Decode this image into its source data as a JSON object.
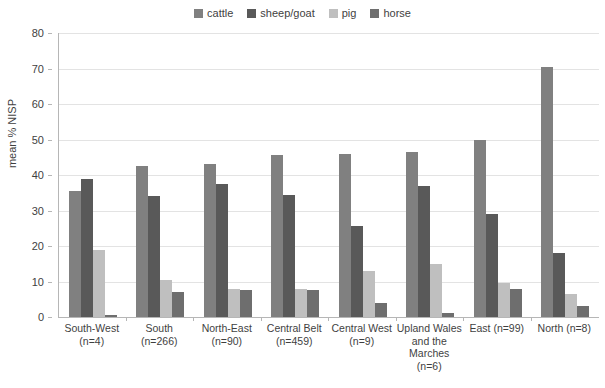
{
  "chart_data": {
    "type": "bar",
    "title": "",
    "xlabel": "",
    "ylabel": "mean % NISP",
    "ylim": [
      0,
      80
    ],
    "ytick_step": 10,
    "yticks": [
      80,
      70,
      60,
      50,
      40,
      30,
      20,
      10,
      0
    ],
    "grid": true,
    "legend_position": "top-center",
    "categories": [
      "South-West\n(n=4)",
      "South\n(n=266)",
      "North-East\n(n=90)",
      "Central Belt\n(n=459)",
      "Central West\n(n=9)",
      "Upland Wales and the Marches\n(n=6)",
      "East (n=99)",
      "North (n=8)"
    ],
    "category_lines": [
      [
        "South-West",
        "(n=4)"
      ],
      [
        "South",
        "(n=266)"
      ],
      [
        "North-East",
        "(n=90)"
      ],
      [
        "Central Belt",
        "(n=459)"
      ],
      [
        "Central West",
        "(n=9)"
      ],
      [
        "Upland Wales",
        "and the",
        "Marches",
        "(n=6)"
      ],
      [
        "East (n=99)"
      ],
      [
        "North (n=8)"
      ]
    ],
    "series": [
      {
        "name": "cattle",
        "color": "#808080",
        "values": [
          35.5,
          42.5,
          43.0,
          45.5,
          46.0,
          46.5,
          50.0,
          70.5
        ]
      },
      {
        "name": "sheep/goat",
        "color": "#595959",
        "values": [
          39.0,
          34.0,
          37.5,
          34.5,
          25.5,
          37.0,
          29.0,
          18.0
        ]
      },
      {
        "name": "pig",
        "color": "#bfbfbf",
        "values": [
          19.0,
          10.5,
          8.0,
          8.0,
          13.0,
          15.0,
          9.5,
          6.5
        ]
      },
      {
        "name": "horse",
        "color": "#6e6e6e",
        "values": [
          0.5,
          7.0,
          7.5,
          7.5,
          4.0,
          1.0,
          8.0,
          3.0
        ]
      }
    ]
  }
}
